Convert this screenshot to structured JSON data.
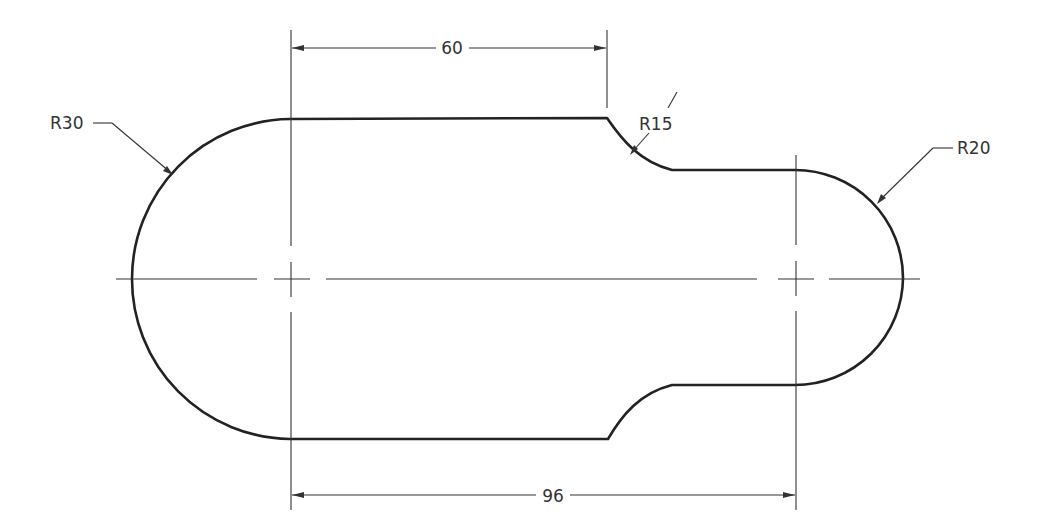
{
  "drawing": {
    "type": "mechanical part outline (slotted link)",
    "dimensions": {
      "top_linear": {
        "label": "60"
      },
      "bottom_linear": {
        "label": "96"
      },
      "left_radius": {
        "label": "R30"
      },
      "fillet_radius": {
        "label": "R15"
      },
      "right_radius": {
        "label": "R20"
      }
    },
    "colors": {
      "outline": "#222222",
      "thin_lines": "#333333",
      "background": "#ffffff"
    }
  }
}
